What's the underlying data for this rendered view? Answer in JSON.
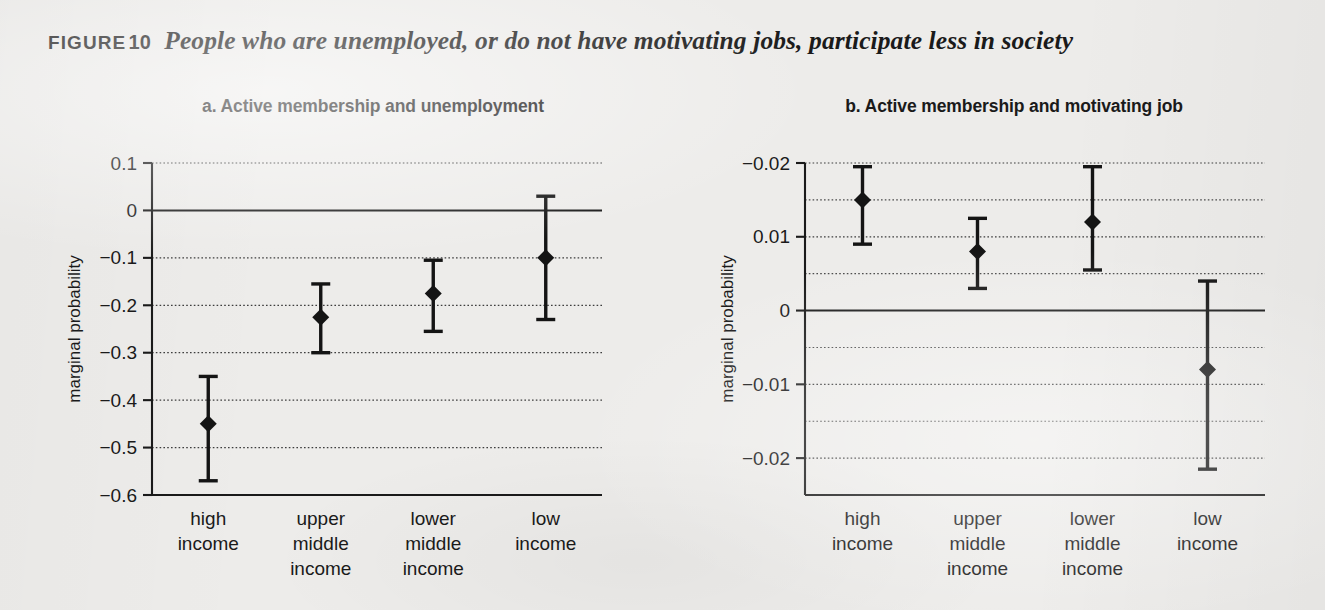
{
  "figure": {
    "tag": "FIGURE",
    "number": "10",
    "caption": "People who are unemployed, or do not have motivating jobs, participate less in society"
  },
  "chart_data": [
    {
      "id": "panel-a",
      "type": "scatter",
      "title": "a.  Active membership and unemployment",
      "xlabel": "",
      "ylabel": "marginal probability",
      "categories": [
        "high\nincome",
        "upper\nmiddle\nincome",
        "lower\nmiddle\nincome",
        "low\nincome"
      ],
      "category_lines": [
        [
          "high",
          "income"
        ],
        [
          "upper",
          "middle",
          "income"
        ],
        [
          "lower",
          "middle",
          "income"
        ],
        [
          "low",
          "income"
        ]
      ],
      "values": [
        -0.45,
        -0.225,
        -0.175,
        -0.1
      ],
      "ci_low": [
        -0.57,
        -0.3,
        -0.255,
        -0.23
      ],
      "ci_high": [
        -0.35,
        -0.155,
        -0.105,
        0.03
      ],
      "ylim": [
        -0.6,
        0.1
      ],
      "yticks": [
        0.1,
        0,
        -0.1,
        -0.2,
        -0.3,
        -0.4,
        -0.5,
        -0.6
      ],
      "ytick_labels": [
        "0.1",
        "0",
        "−0.1",
        "−0.2",
        "−0.3",
        "−0.4",
        "−0.5",
        "−0.6"
      ],
      "gridlines_major": [
        0.1,
        -0.1,
        -0.2,
        -0.3,
        -0.4,
        -0.5
      ],
      "gridlines_minor": [],
      "zero_line": 0,
      "grid": true,
      "legend": "none"
    },
    {
      "id": "panel-b",
      "type": "scatter",
      "title": "b.  Active membership and motivating job",
      "xlabel": "",
      "ylabel": "marginal probability",
      "categories": [
        "high\nincome",
        "upper\nmiddle\nincome",
        "lower\nmiddle\nincome",
        "low\nincome"
      ],
      "category_lines": [
        [
          "high",
          "income"
        ],
        [
          "upper",
          "middle",
          "income"
        ],
        [
          "lower",
          "middle",
          "income"
        ],
        [
          "low",
          "income"
        ]
      ],
      "values": [
        0.015,
        0.008,
        0.012,
        -0.008
      ],
      "ci_low": [
        0.009,
        0.003,
        0.0055,
        -0.0215
      ],
      "ci_high": [
        0.0195,
        0.0125,
        0.0195,
        0.004
      ],
      "ylim": [
        -0.025,
        0.02
      ],
      "yticks": [
        0.02,
        0.01,
        0,
        -0.01,
        -0.02
      ],
      "ytick_labels": [
        "−0.02",
        "0.01",
        "0",
        "−0.01",
        "−0.02"
      ],
      "gridlines_major": [
        0.02,
        0.01,
        -0.01,
        -0.02
      ],
      "gridlines_minor": [
        0.015,
        0.005,
        -0.005,
        -0.015
      ],
      "zero_line": 0,
      "grid": true,
      "legend": "none"
    }
  ]
}
